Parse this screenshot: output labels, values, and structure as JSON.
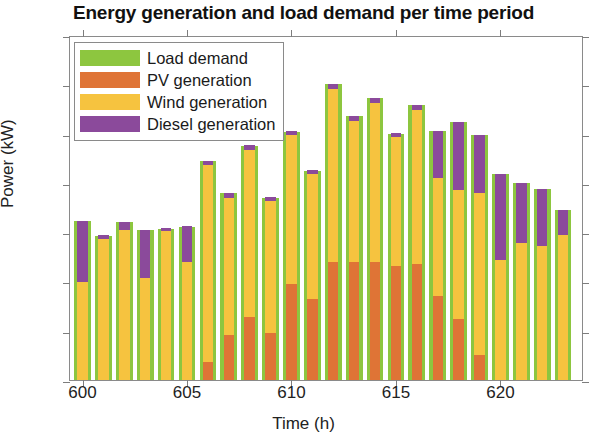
{
  "chart_data": {
    "type": "bar",
    "title": "Energy generation and load demand per time period",
    "xlabel": "Time (h)",
    "ylabel": "Power (kW)",
    "xlim": [
      599.4,
      624.0
    ],
    "ylim": [
      0,
      350
    ],
    "yticks": [
      0,
      50,
      100,
      150,
      200,
      250,
      300,
      350
    ],
    "xticks": [
      600,
      605,
      610,
      615,
      620
    ],
    "grid": false,
    "legend_position": "top-left",
    "stacked": true,
    "legend": [
      "Load demand",
      "PV generation",
      "Wind generation",
      "Diesel generation"
    ],
    "colors": {
      "load": "#8DC63F",
      "pv": "#DF7436",
      "wind": "#F6C33F",
      "diesel": "#8B4A9B"
    },
    "x": [
      600,
      601,
      602,
      603,
      604,
      605,
      606,
      607,
      608,
      609,
      610,
      611,
      612,
      613,
      614,
      615,
      616,
      617,
      618,
      619,
      620,
      621,
      622,
      623
    ],
    "series": [
      {
        "name": "Load demand",
        "key": "load",
        "values": [
          161,
          146,
          160,
          152,
          153,
          155,
          222,
          190,
          237,
          185,
          252,
          212,
          300,
          268,
          286,
          250,
          279,
          253,
          262,
          249,
          209,
          200,
          194,
          172
        ]
      },
      {
        "name": "PV generation",
        "key": "pv",
        "values": [
          0,
          0,
          0,
          0,
          0,
          0,
          18,
          46,
          64,
          48,
          97,
          82,
          120,
          120,
          120,
          116,
          118,
          85,
          62,
          25,
          0,
          0,
          0,
          0
        ]
      },
      {
        "name": "Wind generation",
        "key": "wind",
        "values": [
          99,
          143,
          152,
          103,
          151,
          120,
          200,
          139,
          169,
          134,
          152,
          127,
          175,
          143,
          161,
          131,
          156,
          120,
          131,
          165,
          122,
          139,
          136,
          147
        ]
      },
      {
        "name": "Diesel generation",
        "key": "diesel",
        "values": [
          62,
          4,
          8,
          49,
          3,
          36,
          4,
          5,
          5,
          4,
          4,
          4,
          5,
          5,
          5,
          4,
          5,
          48,
          69,
          59,
          87,
          61,
          58,
          25
        ]
      }
    ]
  }
}
